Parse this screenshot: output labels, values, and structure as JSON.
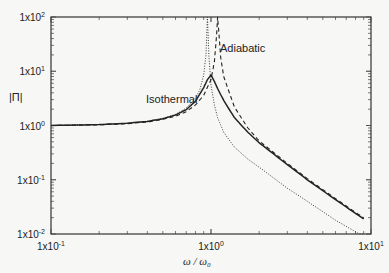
{
  "chart_data": {
    "type": "line",
    "title": "",
    "xlabel": "ω / ω₀",
    "ylabel": "|Π|",
    "xscale": "log",
    "yscale": "log",
    "xlim": [
      0.1,
      10
    ],
    "ylim": [
      0.01,
      100
    ],
    "grid": false,
    "x_ticks": [
      "1x10-1",
      "1x100",
      "1x101"
    ],
    "x_ticks_display": [
      {
        "base": "1x10",
        "exp": "-1"
      },
      {
        "base": "1x10",
        "exp": "0"
      },
      {
        "base": "1x10",
        "exp": "1"
      }
    ],
    "y_ticks_display": [
      {
        "base": "1x10",
        "exp": "2"
      },
      {
        "base": "1x10",
        "exp": "1"
      },
      {
        "base": "1x10",
        "exp": "0"
      },
      {
        "base": "1x10",
        "exp": "-1"
      },
      {
        "base": "1x10",
        "exp": "-2"
      }
    ],
    "annotations": [
      {
        "text": "Adiabatic",
        "x": 1.18,
        "y": 28
      },
      {
        "text": "Isothermal",
        "x": 0.45,
        "y": 3.5
      }
    ],
    "series": [
      {
        "name": "solid (measured/intermediate)",
        "style": "solid",
        "x": [
          0.1,
          0.2,
          0.3,
          0.4,
          0.5,
          0.6,
          0.7,
          0.8,
          0.9,
          0.95,
          1.0,
          1.05,
          1.1,
          1.2,
          1.4,
          1.7,
          2.0,
          3.0,
          4.0,
          6.0,
          8.0,
          9.0
        ],
        "y": [
          1.0,
          1.04,
          1.1,
          1.19,
          1.33,
          1.56,
          1.96,
          2.8,
          5.0,
          7.0,
          8.5,
          6.5,
          4.8,
          2.9,
          1.4,
          0.75,
          0.48,
          0.19,
          0.1,
          0.043,
          0.024,
          0.019
        ]
      },
      {
        "name": "dashed (adiabatic)",
        "style": "dashed",
        "x": [
          0.1,
          0.2,
          0.3,
          0.4,
          0.5,
          0.6,
          0.7,
          0.8,
          0.9,
          1.0,
          1.05,
          1.08,
          1.1,
          1.15,
          1.2,
          1.4,
          1.7,
          2.0,
          3.0,
          4.0,
          6.0,
          8.0,
          9.0
        ],
        "y": [
          1.0,
          1.03,
          1.08,
          1.16,
          1.3,
          1.48,
          1.8,
          2.4,
          3.6,
          7.0,
          15.0,
          40.0,
          100.0,
          18.0,
          8.0,
          2.2,
          0.9,
          0.52,
          0.2,
          0.105,
          0.045,
          0.025,
          0.02
        ]
      },
      {
        "name": "dotted (isothermal)",
        "style": "dotted",
        "x": [
          0.1,
          0.2,
          0.3,
          0.4,
          0.5,
          0.6,
          0.7,
          0.8,
          0.85,
          0.9,
          0.93,
          0.95,
          0.97,
          1.0,
          1.05,
          1.1,
          1.2,
          1.4,
          1.7,
          2.0,
          3.0,
          4.0,
          6.0,
          8.0,
          9.0
        ],
        "y": [
          1.0,
          1.04,
          1.1,
          1.2,
          1.36,
          1.6,
          2.1,
          3.2,
          4.5,
          8.5,
          20.0,
          100.0,
          20.0,
          5.5,
          2.4,
          1.4,
          0.75,
          0.4,
          0.24,
          0.17,
          0.07,
          0.04,
          0.018,
          0.011,
          0.009
        ]
      }
    ]
  }
}
